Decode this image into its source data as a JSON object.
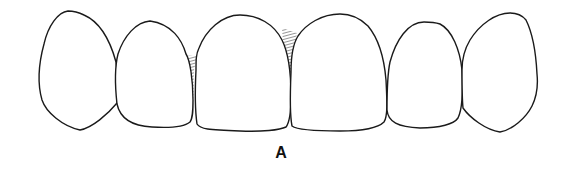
{
  "figure": {
    "label": "A",
    "teeth": [
      {
        "id": "right-canine-viewer-left",
        "name": "canine"
      },
      {
        "id": "lateral-incisor-left",
        "name": "lateral incisor"
      },
      {
        "id": "central-incisor-left",
        "name": "central incisor"
      },
      {
        "id": "central-incisor-right",
        "name": "central incisor"
      },
      {
        "id": "lateral-incisor-right",
        "name": "lateral incisor"
      },
      {
        "id": "left-canine-viewer-right",
        "name": "canine"
      }
    ],
    "colors": {
      "outline": "#1a1a1a",
      "background": "#ffffff",
      "embrasure_shading": "#333333"
    }
  }
}
